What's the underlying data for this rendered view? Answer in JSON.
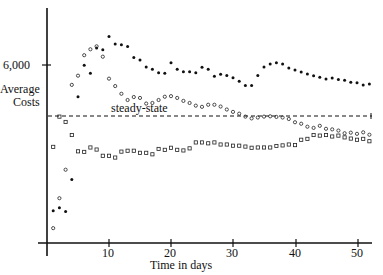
{
  "chart_data": {
    "type": "scatter",
    "title": "",
    "xlabel": "Time in days",
    "ylabel": "Average Costs",
    "x_ticks": [
      10,
      20,
      30,
      40,
      50
    ],
    "y_ticks": [
      {
        "value": 6000,
        "label": "6,000"
      }
    ],
    "xlim": [
      0,
      53
    ],
    "ylim": [
      0,
      7200
    ],
    "grid": false,
    "legend": null,
    "annotations": [
      {
        "text": "steady-state",
        "type": "horizontal-dashed-line",
        "y": 4270
      }
    ],
    "series": [
      {
        "name": "filled-dots",
        "marker": "filled-circle",
        "points": [
          [
            1,
            1090
          ],
          [
            2,
            1190
          ],
          [
            3,
            1060
          ],
          [
            4,
            2140
          ],
          [
            5,
            4930
          ],
          [
            6,
            5990
          ],
          [
            7,
            5720
          ],
          [
            8,
            6570
          ],
          [
            9,
            6510
          ],
          [
            10,
            6960
          ],
          [
            11,
            6710
          ],
          [
            12,
            6680
          ],
          [
            13,
            6620
          ],
          [
            14,
            6250
          ],
          [
            15,
            6170
          ],
          [
            16,
            5930
          ],
          [
            17,
            5860
          ],
          [
            18,
            5740
          ],
          [
            19,
            5720
          ],
          [
            20,
            6080
          ],
          [
            21,
            5860
          ],
          [
            22,
            5770
          ],
          [
            23,
            5770
          ],
          [
            24,
            5740
          ],
          [
            25,
            5920
          ],
          [
            26,
            5860
          ],
          [
            27,
            5620
          ],
          [
            28,
            5690
          ],
          [
            29,
            5650
          ],
          [
            30,
            5570
          ],
          [
            31,
            5450
          ],
          [
            32,
            5310
          ],
          [
            33,
            5310
          ],
          [
            34,
            5650
          ],
          [
            35,
            5930
          ],
          [
            36,
            6030
          ],
          [
            37,
            6080
          ],
          [
            38,
            6030
          ],
          [
            39,
            5900
          ],
          [
            40,
            5830
          ],
          [
            41,
            5760
          ],
          [
            42,
            5700
          ],
          [
            43,
            5640
          ],
          [
            44,
            5590
          ],
          [
            45,
            5530
          ],
          [
            46,
            5560
          ],
          [
            47,
            5510
          ],
          [
            48,
            5490
          ],
          [
            49,
            5420
          ],
          [
            50,
            5400
          ],
          [
            51,
            5330
          ],
          [
            52,
            5360
          ]
        ]
      },
      {
        "name": "open-circles",
        "marker": "open-circle",
        "points": [
          [
            1,
            500
          ],
          [
            2,
            1510
          ],
          [
            3,
            2470
          ],
          [
            4,
            5330
          ],
          [
            5,
            5640
          ],
          [
            6,
            6330
          ],
          [
            7,
            6530
          ],
          [
            8,
            6630
          ],
          [
            9,
            6280
          ],
          [
            10,
            5540
          ],
          [
            11,
            5290
          ],
          [
            12,
            5030
          ],
          [
            13,
            4820
          ],
          [
            14,
            4920
          ],
          [
            15,
            4890
          ],
          [
            16,
            4700
          ],
          [
            17,
            4720
          ],
          [
            18,
            4820
          ],
          [
            19,
            4930
          ],
          [
            20,
            4950
          ],
          [
            21,
            4890
          ],
          [
            22,
            4790
          ],
          [
            23,
            4720
          ],
          [
            24,
            4630
          ],
          [
            25,
            4590
          ],
          [
            26,
            4660
          ],
          [
            27,
            4660
          ],
          [
            28,
            4600
          ],
          [
            29,
            4500
          ],
          [
            30,
            4420
          ],
          [
            31,
            4360
          ],
          [
            32,
            4260
          ],
          [
            33,
            4200
          ],
          [
            34,
            4230
          ],
          [
            35,
            4260
          ],
          [
            36,
            4270
          ],
          [
            37,
            4250
          ],
          [
            38,
            4230
          ],
          [
            39,
            4180
          ],
          [
            40,
            4070
          ],
          [
            41,
            4020
          ],
          [
            42,
            3920
          ],
          [
            43,
            3880
          ],
          [
            44,
            3950
          ],
          [
            45,
            3850
          ],
          [
            46,
            3830
          ],
          [
            47,
            3790
          ],
          [
            48,
            3700
          ],
          [
            49,
            3720
          ],
          [
            50,
            3680
          ],
          [
            51,
            3730
          ],
          [
            52,
            3650
          ]
        ]
      },
      {
        "name": "open-squares",
        "marker": "open-square",
        "points": [
          [
            1,
            3240
          ],
          [
            2,
            4260
          ],
          [
            3,
            4080
          ],
          [
            4,
            3640
          ],
          [
            5,
            3090
          ],
          [
            6,
            3070
          ],
          [
            7,
            3220
          ],
          [
            8,
            3150
          ],
          [
            9,
            2940
          ],
          [
            10,
            2940
          ],
          [
            11,
            2880
          ],
          [
            12,
            3080
          ],
          [
            13,
            3110
          ],
          [
            14,
            3110
          ],
          [
            15,
            3040
          ],
          [
            16,
            3040
          ],
          [
            17,
            2990
          ],
          [
            18,
            3170
          ],
          [
            19,
            3140
          ],
          [
            20,
            3210
          ],
          [
            21,
            3140
          ],
          [
            22,
            3120
          ],
          [
            23,
            3190
          ],
          [
            24,
            3390
          ],
          [
            25,
            3390
          ],
          [
            26,
            3360
          ],
          [
            27,
            3390
          ],
          [
            28,
            3320
          ],
          [
            29,
            3320
          ],
          [
            30,
            3280
          ],
          [
            31,
            3280
          ],
          [
            32,
            3250
          ],
          [
            33,
            3210
          ],
          [
            34,
            3220
          ],
          [
            35,
            3220
          ],
          [
            36,
            3220
          ],
          [
            37,
            3270
          ],
          [
            38,
            3290
          ],
          [
            39,
            3320
          ],
          [
            40,
            3300
          ],
          [
            41,
            3480
          ],
          [
            42,
            3510
          ],
          [
            43,
            3640
          ],
          [
            44,
            3620
          ],
          [
            45,
            3640
          ],
          [
            46,
            3590
          ],
          [
            47,
            3620
          ],
          [
            48,
            3560
          ],
          [
            49,
            3520
          ],
          [
            50,
            3480
          ],
          [
            51,
            3510
          ],
          [
            52,
            3430
          ]
        ]
      }
    ]
  },
  "labels": {
    "y_axis_title_line1": "Average",
    "y_axis_title_line2": "Costs",
    "y_tick_6000": "6,000",
    "steady_state": "steady-state",
    "x_axis_title": "Time in days",
    "x_tick_10": "10",
    "x_tick_20": "20",
    "x_tick_30": "30",
    "x_tick_40": "40",
    "x_tick_50": "50"
  }
}
